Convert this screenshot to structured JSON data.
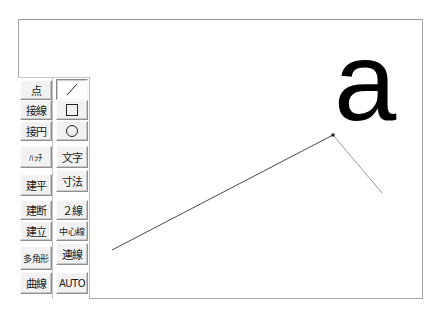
{
  "canvas": {
    "text_glyph": "a"
  },
  "toolbar": {
    "left_column": [
      {
        "id": "point",
        "label": "点"
      },
      {
        "id": "tangent-line",
        "label": "接線"
      },
      {
        "id": "tangent-circle",
        "label": "接円"
      },
      {
        "id": "hatch",
        "label": "ﾊｯﾁ"
      },
      {
        "id": "elevation-plan",
        "label": "建平"
      },
      {
        "id": "elevation-section",
        "label": "建断"
      },
      {
        "id": "elevation-front",
        "label": "建立"
      },
      {
        "id": "polygon",
        "label": "多角形"
      },
      {
        "id": "curve",
        "label": "曲線"
      }
    ],
    "right_column": [
      {
        "id": "line",
        "label": "",
        "icon": "line-icon",
        "pressed": true
      },
      {
        "id": "rectangle",
        "label": "",
        "icon": "rectangle-icon"
      },
      {
        "id": "circle",
        "label": "",
        "icon": "circle-icon"
      },
      {
        "id": "text",
        "label": "文字"
      },
      {
        "id": "dimension",
        "label": "寸法"
      },
      {
        "id": "double-line",
        "label": "２線"
      },
      {
        "id": "center-line",
        "label": "中心線"
      },
      {
        "id": "continuous-line",
        "label": "連線"
      },
      {
        "id": "auto",
        "label": "AUTO"
      }
    ]
  },
  "drawing": {
    "polyline": [
      [
        112,
        250
      ],
      [
        333,
        135
      ],
      [
        382,
        193
      ]
    ],
    "line_color": "#555555",
    "preview_color": "#9a9a9a"
  }
}
